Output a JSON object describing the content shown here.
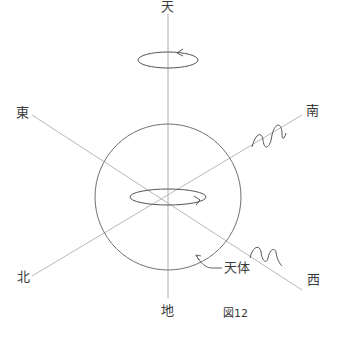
{
  "figure": {
    "caption": "図12",
    "labels": {
      "top": "天",
      "bottom": "地",
      "east": "東",
      "west": "西",
      "south": "南",
      "north": "北",
      "body": "天体"
    }
  },
  "colors": {
    "axis_line": "#b8b8b8",
    "outline": "#6a6a6a",
    "text": "#3a3a3a"
  }
}
